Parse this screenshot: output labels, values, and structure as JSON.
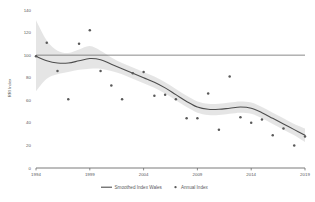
{
  "chart_data": {
    "type": "line",
    "title": "",
    "xlabel": "",
    "ylabel": "RRI Index",
    "xlim": [
      1994,
      2019
    ],
    "ylim": [
      0,
      140
    ],
    "grid": false,
    "legend_position": "bottom",
    "yticks": [
      0,
      20,
      40,
      60,
      80,
      100,
      120,
      140
    ],
    "ytick_labels": [
      "0",
      "20",
      "40",
      "60",
      "80",
      "100",
      "120",
      "140"
    ],
    "xticks": [
      1994,
      1999,
      2004,
      2009,
      2014,
      2019
    ],
    "xtick_labels": [
      "1994",
      "1999",
      "2004",
      "2009",
      "2014",
      "2019"
    ],
    "reference_line": {
      "y": 100,
      "label": ""
    },
    "series": [
      {
        "name": "Smoothed Index Wales",
        "type": "line",
        "color": "#4d4d4d",
        "x": [
          1994,
          1995,
          1996,
          1997,
          1998,
          1999,
          2000,
          2001,
          2002,
          2003,
          2004,
          2005,
          2006,
          2007,
          2008,
          2009,
          2010,
          2011,
          2012,
          2013,
          2014,
          2015,
          2016,
          2017,
          2018,
          2019
        ],
        "values": [
          99,
          95,
          93,
          93,
          95,
          97,
          96,
          92,
          88,
          84,
          80,
          76,
          71,
          65,
          59,
          54,
          52,
          52,
          53,
          54,
          53,
          49,
          44,
          39,
          34,
          29
        ]
      },
      {
        "name": "Annual Index",
        "type": "scatter",
        "color": "#595959",
        "x": [
          1994,
          1995,
          1996,
          1997,
          1998,
          1999,
          2000,
          2001,
          2002,
          2003,
          2004,
          2005,
          2006,
          2007,
          2008,
          2009,
          2010,
          2011,
          2012,
          2013,
          2014,
          2015,
          2016,
          2017,
          2018,
          2019
        ],
        "values": [
          99,
          111,
          86,
          61,
          110,
          122,
          86,
          73,
          61,
          84,
          85,
          64,
          65,
          61,
          44,
          44,
          66,
          34,
          81,
          45,
          40,
          43,
          29,
          35,
          20,
          28
        ]
      }
    ],
    "confidence_band": {
      "name": "Confidence Interval",
      "color": "#e2e2e2",
      "x": [
        1994,
        1995,
        1996,
        1997,
        1998,
        1999,
        2000,
        2001,
        2002,
        2003,
        2004,
        2005,
        2006,
        2007,
        2008,
        2009,
        2010,
        2011,
        2012,
        2013,
        2014,
        2015,
        2016,
        2017,
        2018,
        2019
      ],
      "upper": [
        131,
        113,
        104,
        102,
        105,
        108,
        104,
        98,
        93,
        89,
        85,
        81,
        76,
        70,
        64,
        59,
        57,
        57,
        58,
        59,
        58,
        54,
        49,
        44,
        39,
        35
      ],
      "lower": [
        68,
        79,
        83,
        85,
        87,
        88,
        88,
        86,
        83,
        79,
        75,
        71,
        66,
        60,
        54,
        49,
        47,
        47,
        48,
        49,
        48,
        44,
        39,
        34,
        29,
        23
      ]
    }
  },
  "legend": {
    "items": [
      {
        "label": "Smoothed Index Wales",
        "marker": "line",
        "color": "#4d4d4d"
      },
      {
        "label": "Annual Index",
        "marker": "dot",
        "color": "#595959"
      }
    ]
  },
  "axes": {
    "y_title": "RRI Index"
  }
}
